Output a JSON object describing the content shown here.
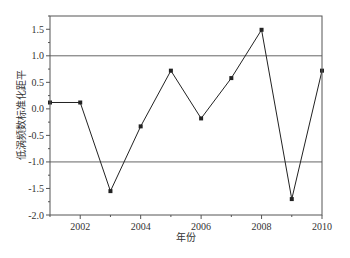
{
  "chart_data": {
    "type": "line",
    "title": "",
    "xlabel": "年份",
    "ylabel": "低涡频数标准化距平",
    "x": [
      2001,
      2002,
      2003,
      2004,
      2005,
      2006,
      2007,
      2008,
      2009,
      2010
    ],
    "series": [
      {
        "name": "低涡频数标准化距平",
        "values": [
          0.12,
          0.12,
          -1.55,
          -0.33,
          0.72,
          -0.18,
          0.58,
          1.49,
          -1.7,
          0.72
        ],
        "marker": "square",
        "color": "#222222"
      }
    ],
    "reference_lines": [
      1.0,
      -1.0
    ],
    "xlim": [
      2001,
      2010
    ],
    "ylim": [
      -2.0,
      1.75
    ],
    "x_ticks": [
      2002,
      2004,
      2006,
      2008,
      2010
    ],
    "x_tick_labels": [
      "2002",
      "2004",
      "2006",
      "2008",
      "2010"
    ],
    "y_ticks": [
      -2.0,
      -1.5,
      -1.0,
      -0.5,
      0.0,
      0.5,
      1.0,
      1.5
    ],
    "y_tick_labels": [
      "-2.0",
      "-1.5",
      "-1.0",
      "-0.5",
      "0.0",
      "0.5",
      "1.0",
      "1.5"
    ],
    "grid": false,
    "legend": "none"
  }
}
